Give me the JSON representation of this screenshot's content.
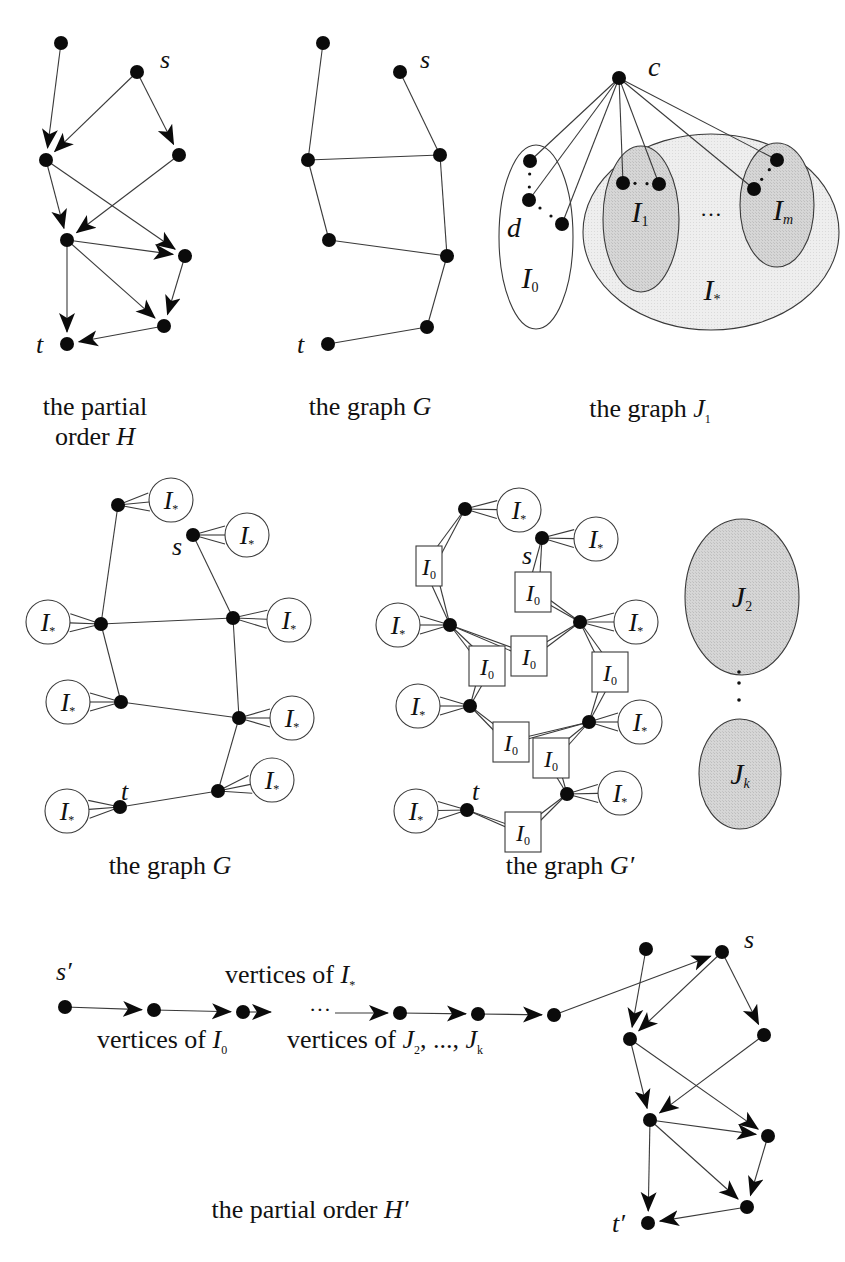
{
  "figure": {
    "colors": {
      "vertex": "#0b0b0b",
      "edge": "#3a3a3a",
      "shade_light": "#ebebeb",
      "shade_dark": "#d2d2d2",
      "background": "#ffffff"
    },
    "panels": {
      "partial_order_H": {
        "caption_line1": "the partial",
        "caption_line2_text": "order ",
        "caption_line2_var": "H",
        "labels": [
          {
            "text": "s",
            "x": 160,
            "y": 68
          },
          {
            "text": "t",
            "x": 36,
            "y": 353
          }
        ],
        "vertices": [
          [
            61,
            43
          ],
          [
            137,
            72
          ],
          [
            46,
            160
          ],
          [
            179,
            155
          ],
          [
            67,
            240
          ],
          [
            185,
            256
          ],
          [
            164,
            326
          ],
          [
            67,
            344
          ]
        ],
        "arcs": [
          [
            0,
            2
          ],
          [
            1,
            2
          ],
          [
            1,
            3
          ],
          [
            2,
            4
          ],
          [
            2,
            5
          ],
          [
            3,
            4
          ],
          [
            4,
            5
          ],
          [
            4,
            6
          ],
          [
            4,
            7
          ],
          [
            5,
            6
          ],
          [
            6,
            7
          ]
        ]
      },
      "graph_G_top": {
        "caption_text": "the graph ",
        "caption_var": "G",
        "labels": [
          {
            "text": "s",
            "x": 420,
            "y": 68
          },
          {
            "text": "t",
            "x": 297,
            "y": 353
          }
        ],
        "vertices": [
          [
            323,
            43
          ],
          [
            400,
            72
          ],
          [
            308,
            160
          ],
          [
            440,
            155
          ],
          [
            329,
            240
          ],
          [
            447,
            256
          ],
          [
            427,
            327
          ],
          [
            328,
            344
          ]
        ],
        "edges": [
          [
            0,
            2
          ],
          [
            1,
            3
          ],
          [
            2,
            3
          ],
          [
            2,
            4
          ],
          [
            3,
            5
          ],
          [
            4,
            5
          ],
          [
            5,
            6
          ],
          [
            6,
            7
          ]
        ]
      },
      "graph_J1": {
        "caption_text": "the graph ",
        "caption_var": "J",
        "caption_sub": "1",
        "center_label": "c",
        "center": [
          619,
          78
        ],
        "I0": {
          "label": "I",
          "sub": "0",
          "cx": 536,
          "cy": 237,
          "rx": 37,
          "ry": 92
        },
        "Istar": {
          "label": "I",
          "sub": "*",
          "cx": 711,
          "cy": 232,
          "rx": 128,
          "ry": 98
        },
        "I1": {
          "label": "I",
          "sub": "1",
          "cx": 641,
          "cy": 219,
          "rx": 38,
          "ry": 73
        },
        "Im": {
          "label": "I",
          "sub": "m",
          "cx": 777,
          "cy": 205,
          "rx": 37,
          "ry": 62
        },
        "d_label": "d",
        "I0_vertices": [
          [
            530,
            161
          ],
          [
            529,
            200
          ],
          [
            562,
            224
          ]
        ],
        "I1_vertices": [
          [
            623,
            183
          ],
          [
            659,
            184
          ]
        ],
        "Im_vertices": [
          [
            777,
            160
          ],
          [
            754,
            189
          ]
        ],
        "ellipsis": "…"
      },
      "graph_G_mid": {
        "caption_text": "the graph ",
        "caption_var": "G",
        "labels": [
          {
            "text": "s",
            "x": 172,
            "y": 555
          },
          {
            "text": "t",
            "x": 121,
            "y": 800
          }
        ],
        "vertices": [
          [
            118,
            505
          ],
          [
            193,
            535
          ],
          [
            101,
            624
          ],
          [
            233,
            618
          ],
          [
            121,
            702
          ],
          [
            239,
            718
          ],
          [
            218,
            791
          ],
          [
            120,
            807
          ]
        ],
        "edges": [
          [
            0,
            2
          ],
          [
            1,
            3
          ],
          [
            2,
            3
          ],
          [
            2,
            4
          ],
          [
            3,
            5
          ],
          [
            4,
            5
          ],
          [
            5,
            6
          ],
          [
            6,
            7
          ]
        ],
        "attachments": [
          {
            "v": 0,
            "cx": 171,
            "cy": 500
          },
          {
            "v": 1,
            "cx": 247,
            "cy": 535
          },
          {
            "v": 2,
            "cx": 48,
            "cy": 622
          },
          {
            "v": 3,
            "cx": 289,
            "cy": 620
          },
          {
            "v": 4,
            "cx": 68,
            "cy": 702
          },
          {
            "v": 5,
            "cx": 292,
            "cy": 718
          },
          {
            "v": 6,
            "cx": 272,
            "cy": 780
          },
          {
            "v": 7,
            "cx": 67,
            "cy": 811
          }
        ],
        "circle_label": "I",
        "circle_sub": "*"
      },
      "graph_G_prime": {
        "caption_text": "the graph ",
        "caption_var": "G′",
        "labels": [
          {
            "text": "s",
            "x": 522,
            "y": 564
          },
          {
            "text": "t",
            "x": 472,
            "y": 800
          }
        ],
        "vertices": [
          [
            465,
            509
          ],
          [
            542,
            538
          ],
          [
            450,
            625
          ],
          [
            580,
            622
          ],
          [
            470,
            706
          ],
          [
            589,
            722
          ],
          [
            567,
            794
          ],
          [
            467,
            810
          ]
        ],
        "attachments": [
          {
            "v": 0,
            "cx": 519,
            "cy": 510
          },
          {
            "v": 1,
            "cx": 596,
            "cy": 539
          },
          {
            "v": 2,
            "cx": 398,
            "cy": 625
          },
          {
            "v": 3,
            "cx": 636,
            "cy": 622
          },
          {
            "v": 4,
            "cx": 418,
            "cy": 706
          },
          {
            "v": 5,
            "cx": 640,
            "cy": 722
          },
          {
            "v": 6,
            "cx": 620,
            "cy": 793
          },
          {
            "v": 7,
            "cx": 416,
            "cy": 811
          }
        ],
        "boxes": [
          {
            "x": 416,
            "y": 546,
            "w": 26,
            "h": 40,
            "a": 0,
            "b": 2
          },
          {
            "x": 515,
            "y": 572,
            "w": 36,
            "h": 40,
            "a": 1,
            "b": 3
          },
          {
            "x": 511,
            "y": 636,
            "w": 36,
            "h": 40,
            "a": 2,
            "b": 3
          },
          {
            "x": 469,
            "y": 646,
            "w": 36,
            "h": 40,
            "a": 2,
            "b": 4
          },
          {
            "x": 592,
            "y": 652,
            "w": 36,
            "h": 40,
            "a": 3,
            "b": 5
          },
          {
            "x": 493,
            "y": 722,
            "w": 36,
            "h": 40,
            "a": 4,
            "b": 5
          },
          {
            "x": 533,
            "y": 738,
            "w": 36,
            "h": 40,
            "a": 5,
            "b": 6
          },
          {
            "x": 505,
            "y": 812,
            "w": 36,
            "h": 40,
            "a": 6,
            "b": 7
          }
        ],
        "box_label": "I",
        "box_sub": "0",
        "circle_label": "I",
        "circle_sub": "*"
      },
      "J_stack": {
        "J2": {
          "label": "J",
          "sub": "2",
          "cx": 742,
          "cy": 597,
          "rx": 57,
          "ry": 78
        },
        "Jk": {
          "label": "J",
          "sub": "k",
          "cx": 740,
          "cy": 774,
          "rx": 41,
          "ry": 55
        },
        "vdots_x": 739,
        "vdots_y": [
          672,
          683,
          700
        ]
      },
      "partial_order_H_prime": {
        "caption_text": "the partial order ",
        "caption_var": "H′",
        "s_prime_label": "s′",
        "t_prime_label": "t′",
        "s_label": "s",
        "chain_vertices": [
          [
            65,
            1007
          ],
          [
            154,
            1010
          ],
          [
            243,
            1012
          ],
          [
            400,
            1013
          ],
          [
            478,
            1014
          ],
          [
            554,
            1015
          ]
        ],
        "chain_ellipsis": "···",
        "label_vertices_Istar": "vertices of ",
        "label_vertices_Istar_var": "I",
        "label_vertices_Istar_sub": "*",
        "label_vertices_I0": "vertices of ",
        "label_vertices_I0_var": "I",
        "label_vertices_I0_sub": "0",
        "label_vertices_J": "vertices of ",
        "label_vertices_J_var1": "J",
        "label_vertices_J_sub1": "2",
        "label_vertices_J_mid": ", ..., ",
        "label_vertices_J_var2": "J",
        "label_vertices_J_sub2": "k",
        "vertices": [
          [
            646,
            949
          ],
          [
            722,
            952
          ],
          [
            630,
            1039
          ],
          [
            764,
            1035
          ],
          [
            650,
            1120
          ],
          [
            768,
            1136
          ],
          [
            747,
            1207
          ],
          [
            648,
            1223
          ]
        ],
        "arcs": [
          [
            0,
            2
          ],
          [
            1,
            2
          ],
          [
            1,
            3
          ],
          [
            2,
            4
          ],
          [
            2,
            5
          ],
          [
            3,
            4
          ],
          [
            4,
            5
          ],
          [
            4,
            6
          ],
          [
            4,
            7
          ],
          [
            5,
            6
          ],
          [
            6,
            7
          ]
        ]
      }
    }
  }
}
